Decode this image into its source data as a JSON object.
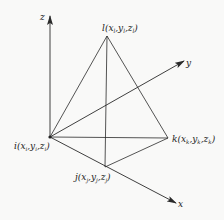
{
  "diagram": {
    "type": "tetrahedron-element-3d-axes",
    "colors": {
      "line": "#2a2a2a",
      "background": "#f9f9f8",
      "text": "#222222"
    },
    "axes": {
      "x": {
        "label": "x"
      },
      "y": {
        "label": "y"
      },
      "z": {
        "label": "z"
      }
    },
    "nodes": {
      "i": {
        "label": "i(x",
        "sub1": "i",
        "mid1": ",y",
        "sub2": "i",
        "mid2": ",z",
        "sub3": "i",
        "end": ")"
      },
      "j": {
        "label": "j(x",
        "sub1": "j",
        "mid1": ",y",
        "sub2": "j",
        "mid2": ",z",
        "sub3": "j",
        "end": ")"
      },
      "k": {
        "label": "k(x",
        "sub1": "k",
        "mid1": ",y",
        "sub2": "k",
        "mid2": ",z",
        "sub3": "k",
        "end": ")"
      },
      "l": {
        "label": "l(x",
        "sub1": "l",
        "mid1": ",y",
        "sub2": "l",
        "mid2": ",z",
        "sub3": "l",
        "end": ")"
      }
    },
    "edges": [
      [
        "i",
        "l"
      ],
      [
        "l",
        "k"
      ],
      [
        "i",
        "k"
      ],
      [
        "i",
        "j"
      ],
      [
        "j",
        "k"
      ],
      [
        "l",
        "j"
      ]
    ]
  }
}
